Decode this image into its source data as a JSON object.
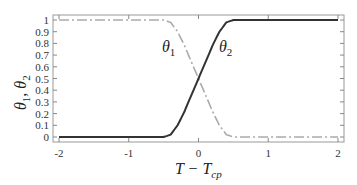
{
  "chart_data": {
    "type": "line",
    "title": "",
    "xlabel": "T − T_cp",
    "ylabel": "θ1, θ2",
    "xlim": [
      -2,
      2
    ],
    "ylim": [
      0,
      1
    ],
    "x_ticks": [
      "-2",
      "-1",
      "0",
      "1",
      "2"
    ],
    "y_ticks": [
      "0",
      "0.1",
      "0.2",
      "0.3",
      "0.4",
      "0.5",
      "0.6",
      "0.7",
      "0.8",
      "0.9",
      "1"
    ],
    "grid": false,
    "legend": "inline labels",
    "x": [
      -2,
      -1,
      -0.5,
      -0.4,
      -0.3,
      -0.2,
      -0.1,
      0,
      0.1,
      0.2,
      0.3,
      0.4,
      0.5,
      1,
      2
    ],
    "series": [
      {
        "name": "θ1",
        "style": "dash-dot",
        "color": "#aaaaaa",
        "values": [
          1,
          1,
          1,
          0.98,
          0.9,
          0.78,
          0.64,
          0.5,
          0.36,
          0.22,
          0.1,
          0.02,
          0,
          0,
          0
        ]
      },
      {
        "name": "θ2",
        "style": "solid",
        "color": "#333333",
        "values": [
          0,
          0,
          0,
          0.02,
          0.1,
          0.22,
          0.36,
          0.5,
          0.64,
          0.78,
          0.9,
          0.98,
          1,
          1,
          1
        ]
      }
    ],
    "annotations": [
      {
        "text": "θ1",
        "x": -0.45,
        "y": 0.75
      },
      {
        "text": "θ2",
        "x": 0.35,
        "y": 0.75
      }
    ]
  },
  "labels": {
    "theta1_main": "θ",
    "theta1_sub": "1",
    "theta2_main": "θ",
    "theta2_sub": "2",
    "xlabel_main": "T − T",
    "xlabel_sub": "cp",
    "ylabel_main1": "θ",
    "ylabel_sub1": "1",
    "ylabel_sep": ",  ",
    "ylabel_main2": "θ",
    "ylabel_sub2": "2"
  }
}
